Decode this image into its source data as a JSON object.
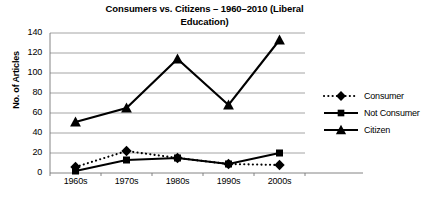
{
  "chart_data": {
    "type": "line",
    "title": "Consumers vs. Citizens – 1960–2010 (Liberal Education)",
    "title_line1": "Consumers vs. Citizens – 1960–2010 (Liberal",
    "title_line2": "Education)",
    "xlabel": "",
    "ylabel": "No. of Articles",
    "categories": [
      "1960s",
      "1970s",
      "1980s",
      "1990s",
      "2000s"
    ],
    "yticks": [
      0,
      20,
      40,
      60,
      80,
      100,
      120,
      140
    ],
    "ylim": [
      0,
      140
    ],
    "grid": true,
    "legend_position": "right",
    "series": [
      {
        "name": "Consumer",
        "values": [
          6,
          22,
          15,
          9,
          8
        ],
        "line_style": "dotted",
        "marker": "diamond",
        "color": "#000000"
      },
      {
        "name": "Not Consumer",
        "values": [
          2,
          13,
          15,
          9,
          20
        ],
        "line_style": "solid",
        "marker": "square",
        "color": "#000000"
      },
      {
        "name": "Citizen",
        "values": [
          51,
          65,
          114,
          68,
          133
        ],
        "line_style": "solid",
        "marker": "triangle",
        "color": "#000000"
      }
    ]
  }
}
